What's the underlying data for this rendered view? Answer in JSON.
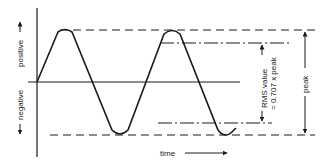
{
  "diagram": {
    "labels": {
      "positive": "positive",
      "negative": "negative",
      "time": "time",
      "rms_line1": "RMS value",
      "rms_line2": "= 0.707 x peak",
      "peak": "peak"
    },
    "colors": {
      "ink": "#1a1a1a",
      "background": "#ffffff"
    }
  }
}
